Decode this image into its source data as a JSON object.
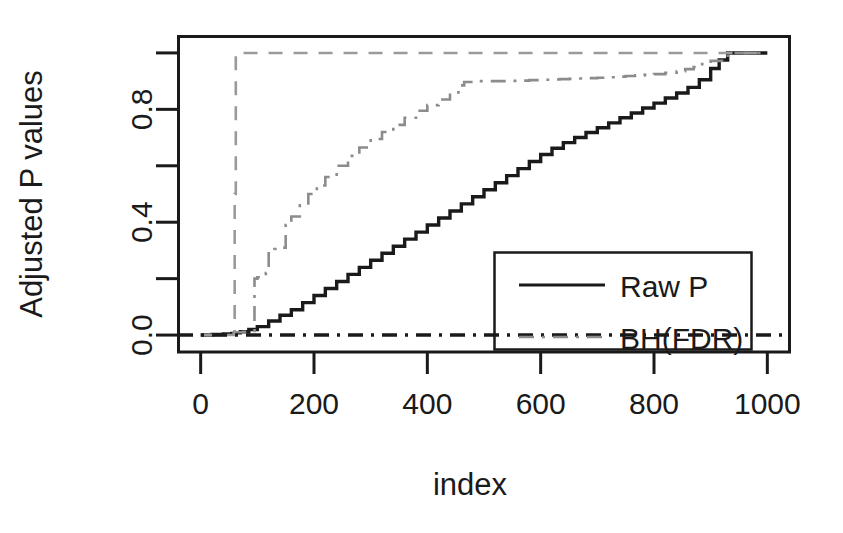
{
  "chart_data": {
    "type": "line",
    "title": "",
    "xlabel": "index",
    "ylabel": "Adjusted P values",
    "xlim": [
      -40,
      1040
    ],
    "ylim": [
      -0.06,
      1.06
    ],
    "xticks": [
      0,
      200,
      400,
      600,
      800,
      1000
    ],
    "xtick_labels": [
      "0",
      "200",
      "400",
      "600",
      "800",
      "1000"
    ],
    "yticks": [
      0.0,
      0.2,
      0.4,
      0.6,
      0.8,
      1.0
    ],
    "ytick_labels": [
      "0.0",
      "",
      "0.4",
      "",
      "0.8",
      ""
    ],
    "grid": false,
    "legend_position": "bottom-right",
    "series": [
      {
        "name": "Raw P",
        "style": "solid",
        "color": "#1a1a1a",
        "x": [
          0,
          20,
          40,
          55,
          60,
          70,
          85,
          100,
          120,
          140,
          160,
          180,
          200,
          220,
          240,
          260,
          280,
          300,
          320,
          340,
          360,
          380,
          400,
          420,
          440,
          460,
          480,
          500,
          520,
          540,
          560,
          580,
          600,
          620,
          640,
          660,
          680,
          700,
          720,
          740,
          760,
          780,
          800,
          820,
          840,
          860,
          880,
          900,
          915,
          930,
          960,
          1000
        ],
        "y": [
          0.0,
          0.002,
          0.004,
          0.006,
          0.008,
          0.012,
          0.02,
          0.03,
          0.05,
          0.07,
          0.09,
          0.115,
          0.14,
          0.165,
          0.19,
          0.215,
          0.24,
          0.265,
          0.29,
          0.315,
          0.34,
          0.365,
          0.39,
          0.415,
          0.44,
          0.465,
          0.49,
          0.515,
          0.54,
          0.565,
          0.59,
          0.615,
          0.64,
          0.662,
          0.682,
          0.7,
          0.718,
          0.735,
          0.752,
          0.77,
          0.787,
          0.805,
          0.822,
          0.84,
          0.858,
          0.878,
          0.905,
          0.945,
          0.975,
          1.0,
          1.0,
          1.0
        ]
      },
      {
        "name": "BH(FDR)",
        "style": "dashdot",
        "color": "#8c8c8c",
        "x": [
          0,
          20,
          40,
          55,
          58,
          60,
          75,
          90,
          95,
          100,
          105,
          115,
          120,
          130,
          140,
          150,
          160,
          175,
          190,
          205,
          220,
          240,
          260,
          280,
          300,
          320,
          340,
          360,
          380,
          400,
          420,
          440,
          455,
          465,
          480,
          520,
          560,
          600,
          650,
          700,
          750,
          800,
          840,
          870,
          900,
          920,
          935,
          960,
          1000
        ],
        "y": [
          0.0,
          0.0,
          0.0,
          0.0,
          0.005,
          0.01,
          0.012,
          0.015,
          0.2,
          0.205,
          0.21,
          0.22,
          0.3,
          0.305,
          0.31,
          0.39,
          0.42,
          0.46,
          0.5,
          0.53,
          0.56,
          0.6,
          0.635,
          0.665,
          0.695,
          0.72,
          0.745,
          0.77,
          0.795,
          0.815,
          0.835,
          0.86,
          0.885,
          0.897,
          0.9,
          0.9,
          0.902,
          0.905,
          0.908,
          0.912,
          0.918,
          0.925,
          0.935,
          0.95,
          0.972,
          0.99,
          1.0,
          1.0,
          1.0
        ]
      },
      {
        "name": "Bonferroni",
        "style": "dashed",
        "color": "#9a9a9a",
        "x": [
          0,
          30,
          50,
          58,
          60,
          62,
          80,
          200,
          400,
          600,
          800,
          930,
          1000
        ],
        "y": [
          0.0,
          0.0,
          0.0,
          0.0,
          0.5,
          1.0,
          1.0,
          1.0,
          1.0,
          1.0,
          1.0,
          1.0,
          1.0
        ]
      },
      {
        "name": "Baseline",
        "style": "dashdot",
        "color": "#1a1a1a",
        "x": [
          -40,
          1040
        ],
        "y": [
          0.0,
          0.0
        ]
      }
    ],
    "legend_entries": [
      {
        "label": "Raw P",
        "style": "solid",
        "color": "#1a1a1a"
      },
      {
        "label": "BH(FDR)",
        "style": "dashdot",
        "color": "#8c8c8c"
      }
    ]
  },
  "colors": {
    "background": "#ffffff",
    "axis": "#1a1a1a",
    "raw_p": "#1a1a1a",
    "bh_fdr": "#8c8c8c",
    "bonferroni": "#9a9a9a"
  }
}
